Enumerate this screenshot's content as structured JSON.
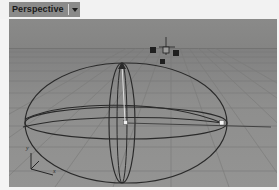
{
  "window": {
    "title": "Perspective viewport"
  },
  "viewport_label": {
    "name": "Perspective",
    "caret": "chevron-down-icon"
  },
  "axis_gizmo": {
    "name": "axis-tripod",
    "y_label": "y",
    "x_label": "x",
    "z_label": "z"
  },
  "scene": {
    "object_name": "sphere-wireframe",
    "grid_name": "ground-grid",
    "horizon_name": "horizon-line",
    "pivot_name": "center-vertex",
    "equator_vertex_name": "equator-vertex",
    "handles_name": "transform-handles"
  },
  "colors": {
    "background": "#8a8a89",
    "ground": "#909090",
    "grid_line": "#7b7b7a",
    "wire": "#2b2b2b",
    "highlight": "#f4f4f4",
    "label_bg": "#8b8b8a",
    "frame": "#f2f2f2"
  }
}
